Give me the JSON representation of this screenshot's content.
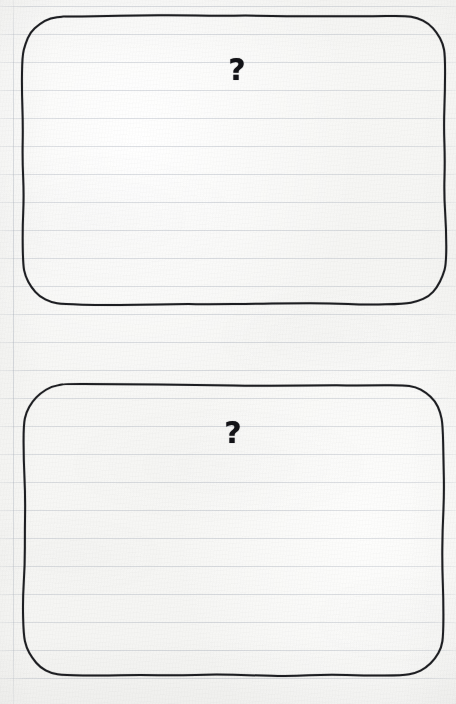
{
  "page": {
    "width": 456,
    "height": 704,
    "paper_color": "#f7f7f5",
    "rule_color": "#969eac",
    "ink_color": "#15161a"
  },
  "paper": {
    "type": "ruled-notebook",
    "rule_spacing": 28,
    "rule_start_y": 6,
    "rule_count": 25,
    "margin_rule_x": 13,
    "margin_rule_label": "left-margin-rule"
  },
  "boxes": [
    {
      "id": "answer-box-1",
      "label": "?",
      "name": "answer-box-top",
      "x": 23,
      "y": 16,
      "width": 422,
      "height": 288,
      "corner_radius": 40,
      "stroke_width": 2,
      "qmark": {
        "text": "?",
        "center_x": 237,
        "center_y": 70,
        "font_size": 30
      }
    },
    {
      "id": "answer-box-2",
      "label": "?",
      "name": "answer-box-bottom",
      "x": 24,
      "y": 385,
      "width": 419,
      "height": 290,
      "corner_radius": 40,
      "stroke_width": 2,
      "qmark": {
        "text": "?",
        "center_x": 233,
        "center_y": 433,
        "font_size": 30
      }
    }
  ]
}
